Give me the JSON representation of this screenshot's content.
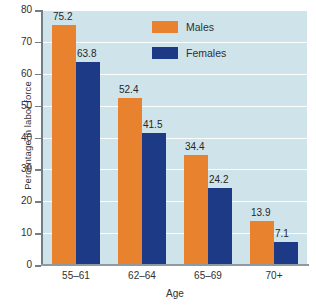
{
  "chart_data": {
    "type": "bar",
    "title": "",
    "xlabel": "Age",
    "ylabel": "Percentage in labor force",
    "categories": [
      "55–61",
      "62–64",
      "65–69",
      "70+"
    ],
    "series": [
      {
        "name": "Males",
        "color": "#e8822e",
        "values": [
          75.2,
          52.4,
          34.4,
          13.9
        ]
      },
      {
        "name": "Females",
        "color": "#1d3a87",
        "values": [
          63.8,
          41.5,
          24.2,
          7.1
        ]
      }
    ],
    "value_labels": {
      "males": [
        "75.2",
        "52.4",
        "34.4",
        "13.9"
      ],
      "females": [
        "63.8",
        "41.5",
        "24.2",
        "7.1"
      ]
    },
    "ylim": [
      0,
      80
    ],
    "yticks": [
      0,
      10,
      20,
      30,
      40,
      50,
      60,
      70,
      80
    ],
    "ytick_labels": [
      "0",
      "10",
      "20",
      "30",
      "40",
      "50",
      "60",
      "70",
      "80"
    ],
    "grid": true,
    "grid_color": "#ffffff",
    "legend_position": "top-right",
    "plot_background": "#cfe4ea",
    "page_background": "#ffffff"
  },
  "legend": {
    "items": [
      {
        "label": "Males"
      },
      {
        "label": "Females"
      }
    ]
  },
  "axes": {
    "y_title": "Percentage in labor force",
    "x_title": "Age"
  }
}
